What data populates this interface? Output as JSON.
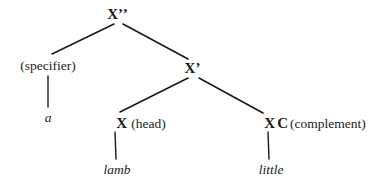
{
  "diagram": {
    "type": "x-bar-syntax-tree",
    "background_color": "#ffffff",
    "ink_color": "#1a1a1a",
    "nodes": {
      "root": {
        "label": "X",
        "primes": "’’",
        "x": 118,
        "y": 14
      },
      "specifier": {
        "label": "(specifier)",
        "x": 48,
        "y": 65
      },
      "xbar": {
        "label": "X",
        "primes": "’",
        "x": 193,
        "y": 68
      },
      "head": {
        "label": "X",
        "annotation": "(head)",
        "x": 114,
        "y": 123
      },
      "complement": {
        "label": "X",
        "category": "C",
        "annotation": "(complement)",
        "x": 268,
        "y": 123
      }
    },
    "leaves": {
      "specifier_word": {
        "text": "a",
        "x": 48,
        "y": 117
      },
      "head_word": {
        "text": "lamb",
        "x": 117,
        "y": 169
      },
      "complement_word": {
        "text": "little",
        "x": 271,
        "y": 169
      }
    },
    "branches": [
      {
        "name": "root-to-specifier",
        "x1": 114,
        "y1": 24,
        "x2": 52,
        "y2": 54
      },
      {
        "name": "root-to-xbar",
        "x1": 123,
        "y1": 24,
        "x2": 188,
        "y2": 59
      },
      {
        "name": "specifier-to-a",
        "x1": 48,
        "y1": 76,
        "x2": 48,
        "y2": 107
      },
      {
        "name": "xbar-to-head",
        "x1": 188,
        "y1": 78,
        "x2": 120,
        "y2": 112
      },
      {
        "name": "xbar-to-complement",
        "x1": 199,
        "y1": 78,
        "x2": 263,
        "y2": 113
      },
      {
        "name": "head-to-lamb",
        "x1": 115,
        "y1": 132,
        "x2": 116,
        "y2": 159
      },
      {
        "name": "complement-to-little",
        "x1": 268,
        "y1": 132,
        "x2": 269,
        "y2": 159
      }
    ]
  }
}
